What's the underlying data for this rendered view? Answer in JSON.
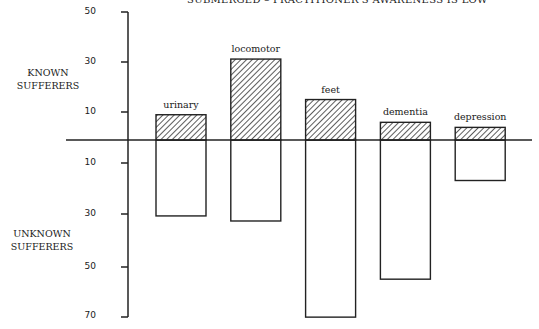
{
  "chart_data": {
    "type": "bar",
    "title": "SUBMERGED – PRACTITIONER'S AWARENESS IS LOW",
    "categories": [
      "urinary",
      "locomotor",
      "feet",
      "dementia",
      "depression"
    ],
    "series": [
      {
        "name": "KNOWN SUFFERERS",
        "direction": "up",
        "fill": "hatched",
        "values": [
          9,
          31,
          15,
          6,
          4
        ]
      },
      {
        "name": "UNKNOWN SUFFERERS",
        "direction": "down",
        "fill": "white",
        "values": [
          31,
          33,
          71,
          56,
          17
        ]
      }
    ],
    "upper_ticks": [
      50,
      30,
      10
    ],
    "lower_ticks": [
      10,
      30,
      50,
      70
    ],
    "upper_label": [
      "KNOWN",
      "SUFFERERS"
    ],
    "lower_label": [
      "UNKNOWN",
      "SUFFERERS"
    ],
    "ylim_up": [
      0,
      50
    ],
    "ylim_down": [
      0,
      70
    ],
    "grid": false,
    "legend": "none"
  }
}
